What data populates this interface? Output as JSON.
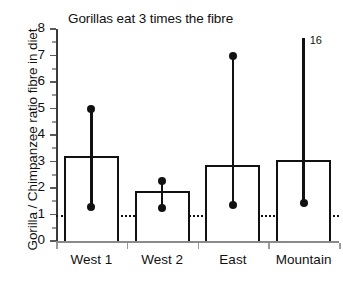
{
  "chart_data": {
    "type": "bar",
    "title": "Gorillas eat 3 times the fibre",
    "xlabel": "",
    "ylabel": "Gorilla / Chimpanzee ratio fibre in diet",
    "categories": [
      "West 1",
      "West 2",
      "East",
      "Mountain"
    ],
    "values": [
      3.2,
      1.9,
      2.88,
      3.05
    ],
    "errorbars": [
      {
        "category": "West 1",
        "low": 1.3,
        "high": 5.0,
        "high_offscale": false,
        "high_label": ""
      },
      {
        "category": "West 2",
        "low": 1.25,
        "high": 2.28,
        "high_offscale": false,
        "high_label": ""
      },
      {
        "category": "East",
        "low": 1.35,
        "high": 7.0,
        "high_offscale": false,
        "high_label": ""
      },
      {
        "category": "Mountain",
        "low": 1.43,
        "high": 16.0,
        "high_offscale": true,
        "high_label": "16"
      }
    ],
    "ylim": [
      0,
      8
    ],
    "yticks": [
      0,
      1,
      2,
      3,
      4,
      5,
      6,
      7,
      8
    ],
    "ytick_labels": [
      "0",
      "1",
      "2",
      "3",
      "4",
      "5",
      "6",
      "7",
      "8"
    ],
    "reference_line": {
      "value": 1,
      "style": "dotted",
      "label": ""
    },
    "grid": false,
    "legend": "none",
    "bar_fill": "#ffffff",
    "bar_stroke": "#111111",
    "marker_color": "#111111"
  }
}
